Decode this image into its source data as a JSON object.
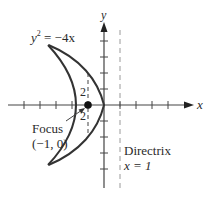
{
  "diagram": {
    "equation": {
      "lhs_var": "y",
      "exp": "2",
      "rhs": " = −4x"
    },
    "axes": {
      "x_label": "x",
      "y_label": "y"
    },
    "focus": {
      "label": "Focus",
      "coords": "(−1, 0)"
    },
    "directrix": {
      "label": "Directrix",
      "equation": "x = 1"
    },
    "latus_rectum_labels": {
      "upper": "2",
      "lower": "2"
    },
    "colors": {
      "axis": "#444444",
      "curve": "#333333",
      "dashed": "#9a9a9a",
      "text": "#2a2a2a"
    }
  }
}
